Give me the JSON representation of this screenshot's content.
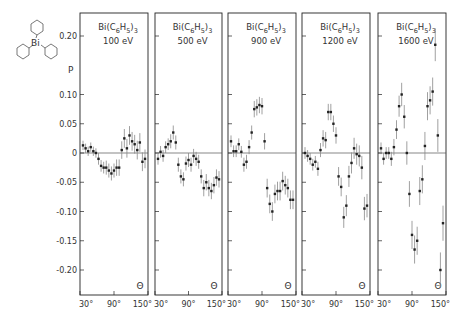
{
  "chart_data": {
    "type": "scatter",
    "title": "",
    "ylabel": "P",
    "xlabel": "Θ",
    "ylim": [
      -0.245,
      0.235
    ],
    "xlim": [
      30,
      150
    ],
    "grid": false,
    "legend_position": "none",
    "yticks": [
      0.2,
      0.1,
      0.05,
      0,
      -0.05,
      -0.1,
      -0.15,
      -0.2
    ],
    "ytick_labels": [
      "0.20",
      "0.10",
      "0.05",
      "0",
      "-0.05",
      "-0.10",
      "-0.15",
      "-0.20"
    ],
    "xticks": [
      30,
      90,
      150
    ],
    "xtick_labels": [
      "30°",
      "90°",
      "150°"
    ],
    "molecule_label": "Bi",
    "panels": [
      {
        "compound": "Bi(C6H5)3",
        "energy": "100 eV",
        "x": [
          30,
          35,
          40,
          45,
          50,
          55,
          60,
          65,
          70,
          75,
          80,
          85,
          90,
          95,
          100,
          105,
          110,
          115,
          120,
          125,
          130,
          135,
          140,
          145,
          150
        ],
        "y": [
          0.013,
          0.008,
          0.003,
          0.01,
          0.003,
          0.0,
          -0.01,
          -0.022,
          -0.025,
          -0.025,
          -0.03,
          -0.035,
          -0.03,
          -0.025,
          -0.025,
          0.005,
          0.025,
          0.008,
          0.03,
          0.02,
          0.015,
          0.005,
          0.018,
          -0.015,
          -0.01
        ],
        "err": [
          0.008,
          0.008,
          0.008,
          0.008,
          0.008,
          0.008,
          0.01,
          0.01,
          0.01,
          0.012,
          0.012,
          0.012,
          0.012,
          0.014,
          0.014,
          0.015,
          0.016,
          0.016,
          0.016,
          0.016,
          0.016,
          0.016,
          0.016,
          0.016,
          0.016
        ]
      },
      {
        "compound": "Bi(C6H5)3",
        "energy": "500 eV",
        "x": [
          30,
          35,
          40,
          45,
          50,
          55,
          60,
          65,
          70,
          75,
          80,
          85,
          90,
          95,
          100,
          105,
          110,
          115,
          120,
          125,
          130,
          135,
          140,
          145,
          150
        ],
        "y": [
          -0.01,
          0.002,
          -0.005,
          0.01,
          0.015,
          0.02,
          0.035,
          0.018,
          -0.02,
          -0.04,
          -0.045,
          -0.018,
          -0.012,
          -0.02,
          -0.005,
          -0.01,
          -0.015,
          -0.04,
          -0.06,
          -0.05,
          -0.06,
          -0.065,
          -0.055,
          -0.042,
          -0.045
        ],
        "err": [
          0.01,
          0.01,
          0.01,
          0.01,
          0.01,
          0.012,
          0.012,
          0.012,
          0.012,
          0.012,
          0.012,
          0.012,
          0.012,
          0.012,
          0.012,
          0.012,
          0.012,
          0.012,
          0.014,
          0.014,
          0.014,
          0.014,
          0.014,
          0.014,
          0.014
        ]
      },
      {
        "compound": "Bi(C6H5)3",
        "energy": "900 eV",
        "x": [
          30,
          35,
          40,
          45,
          50,
          55,
          60,
          65,
          70,
          75,
          80,
          85,
          90,
          95,
          100,
          105,
          110,
          115,
          120,
          125,
          130,
          135,
          140,
          145,
          150
        ],
        "y": [
          0.02,
          0.003,
          0.003,
          0.015,
          0.002,
          -0.02,
          -0.015,
          0.01,
          0.035,
          0.075,
          0.078,
          0.082,
          0.08,
          0.02,
          -0.06,
          -0.087,
          -0.1,
          -0.07,
          -0.065,
          -0.065,
          -0.048,
          -0.055,
          -0.06,
          -0.08,
          -0.08
        ],
        "err": [
          0.01,
          0.01,
          0.01,
          0.01,
          0.01,
          0.012,
          0.012,
          0.012,
          0.012,
          0.014,
          0.014,
          0.014,
          0.014,
          0.014,
          0.016,
          0.016,
          0.016,
          0.016,
          0.016,
          0.016,
          0.016,
          0.016,
          0.016,
          0.016,
          0.016
        ]
      },
      {
        "compound": "Bi(C6H5)3",
        "energy": "1200 eV",
        "x": [
          30,
          35,
          40,
          45,
          50,
          55,
          60,
          65,
          70,
          75,
          80,
          85,
          90,
          95,
          100,
          105,
          110,
          115,
          120,
          125,
          130,
          135,
          140,
          145,
          150
        ],
        "y": [
          0.0,
          -0.005,
          -0.01,
          -0.02,
          -0.015,
          -0.027,
          0.005,
          0.025,
          0.022,
          0.07,
          0.07,
          0.05,
          0.03,
          -0.04,
          -0.058,
          -0.11,
          -0.09,
          -0.04,
          -0.017,
          0.008,
          -0.002,
          -0.005,
          -0.025,
          -0.095,
          -0.09
        ],
        "err": [
          0.01,
          0.01,
          0.01,
          0.01,
          0.01,
          0.012,
          0.012,
          0.014,
          0.014,
          0.014,
          0.014,
          0.014,
          0.014,
          0.016,
          0.016,
          0.018,
          0.018,
          0.018,
          0.018,
          0.018,
          0.018,
          0.018,
          0.02,
          0.02,
          0.02
        ],
        "note": "points near x=150 at y≈-0.095, -0.09"
      },
      {
        "compound": "Bi(C6H5)3",
        "energy": "1600 eV",
        "x": [
          30,
          35,
          40,
          45,
          50,
          55,
          60,
          65,
          70,
          75,
          80,
          85,
          90,
          95,
          100,
          105,
          110,
          115,
          120,
          125,
          130,
          135,
          140,
          145,
          150
        ],
        "y": [
          0.008,
          -0.01,
          0.0,
          0.0,
          -0.01,
          0.01,
          0.04,
          0.08,
          0.1,
          0.062,
          0.0,
          -0.07,
          -0.14,
          -0.165,
          -0.15,
          -0.065,
          -0.045,
          0.012,
          0.08,
          0.09,
          0.105,
          0.185,
          0.03,
          -0.2,
          -0.12
        ],
        "err": [
          0.01,
          0.01,
          0.01,
          0.01,
          0.012,
          0.014,
          0.016,
          0.018,
          0.02,
          0.02,
          0.02,
          0.022,
          0.024,
          0.024,
          0.024,
          0.024,
          0.024,
          0.024,
          0.024,
          0.024,
          0.024,
          0.028,
          0.028,
          0.03,
          0.03
        ]
      }
    ]
  },
  "panel_labels": [
    {
      "compound_prefix": "Bi(C",
      "sub1": "6",
      "mid": "H",
      "sub2": "5",
      "close": ")",
      "sub3": "3",
      "energy": "100 eV"
    },
    {
      "compound_prefix": "Bi(C",
      "sub1": "6",
      "mid": "H",
      "sub2": "5",
      "close": ")",
      "sub3": "3",
      "energy": "500 eV"
    },
    {
      "compound_prefix": "Bi(C",
      "sub1": "6",
      "mid": "H",
      "sub2": "5",
      "close": ")",
      "sub3": "3",
      "energy": "900 eV"
    },
    {
      "compound_prefix": "Bi(C",
      "sub1": "6",
      "mid": "H",
      "sub2": "5",
      "close": ")",
      "sub3": "3",
      "energy": "1200 eV"
    },
    {
      "compound_prefix": "Bi(C",
      "sub1": "6",
      "mid": "H",
      "sub2": "5",
      "close": ")",
      "sub3": "3",
      "energy": "1600 eV"
    }
  ],
  "axis": {
    "y_title": "P",
    "x_symbol": "Θ",
    "molecule_center": "Bi"
  },
  "colors": {
    "ink": "#222222",
    "error_bar": "#888888",
    "background": "#ffffff"
  }
}
